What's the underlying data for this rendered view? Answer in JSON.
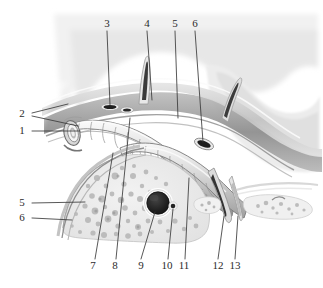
{
  "figure": {
    "width": 323,
    "height": 288,
    "background_color": "#ffffff",
    "line_color": "#3a3a3a",
    "label_color": "#2b2b2b",
    "style": "grayscale medical illustration"
  },
  "palette": {
    "paper": "#ffffff",
    "tissue_light": "#ececec",
    "tissue_mid": "#d2d2d2",
    "tissue_dark": "#9b9b9b",
    "tissue_darker": "#6e6e6e",
    "gland_fill": "#ededed",
    "gland_speckle": "#b6b6b6",
    "lumen_dark": "#2a2a2a",
    "lumen_black": "#1a1a1a",
    "highlight": "#fafafa",
    "leader": "#3a3a3a"
  },
  "labels": [
    {
      "id": "label-1",
      "text": "1",
      "x": 22,
      "y": 131,
      "side": "left"
    },
    {
      "id": "label-2",
      "text": "2",
      "x": 22,
      "y": 114,
      "side": "left"
    },
    {
      "id": "label-3",
      "text": "3",
      "x": 107,
      "y": 24,
      "side": "top"
    },
    {
      "id": "label-4",
      "text": "4",
      "x": 147,
      "y": 24,
      "side": "top"
    },
    {
      "id": "label-5-top",
      "text": "5",
      "x": 175,
      "y": 24,
      "side": "top"
    },
    {
      "id": "label-6-top",
      "text": "6",
      "x": 195,
      "y": 24,
      "side": "top"
    },
    {
      "id": "label-5-left",
      "text": "5",
      "x": 22,
      "y": 203,
      "side": "left"
    },
    {
      "id": "label-6-left",
      "text": "6",
      "x": 22,
      "y": 218,
      "side": "left"
    },
    {
      "id": "label-7",
      "text": "7",
      "x": 93,
      "y": 266,
      "side": "bottom"
    },
    {
      "id": "label-8",
      "text": "8",
      "x": 115,
      "y": 266,
      "side": "bottom"
    },
    {
      "id": "label-9",
      "text": "9",
      "x": 141,
      "y": 266,
      "side": "bottom"
    },
    {
      "id": "label-10",
      "text": "10",
      "x": 167,
      "y": 266,
      "side": "bottom"
    },
    {
      "id": "label-11",
      "text": "11",
      "x": 184,
      "y": 266,
      "side": "bottom"
    },
    {
      "id": "label-12",
      "text": "12",
      "x": 217,
      "y": 266,
      "side": "bottom"
    },
    {
      "id": "label-13",
      "text": "13",
      "x": 234,
      "y": 266,
      "side": "bottom"
    }
  ],
  "leaders": [
    {
      "id": "leader-1",
      "label": "1",
      "points": "32,131 80,131"
    },
    {
      "id": "leader-2a",
      "label": "2",
      "points": "32,113 68,104"
    },
    {
      "id": "leader-2b",
      "label": "2",
      "points": "32,116 78,126"
    },
    {
      "id": "leader-3",
      "label": "3",
      "points": "107,31 110,105"
    },
    {
      "id": "leader-4",
      "label": "4",
      "points": "147,31 152,100"
    },
    {
      "id": "leader-5t",
      "label": "5",
      "points": "175,31 178,118"
    },
    {
      "id": "leader-6t",
      "label": "6",
      "points": "195,31 203,142"
    },
    {
      "id": "leader-5l",
      "label": "5",
      "points": "32,203 85,202"
    },
    {
      "id": "leader-6l",
      "label": "6",
      "points": "32,218 72,220"
    },
    {
      "id": "leader-7",
      "label": "7",
      "points": "95,259 113,153"
    },
    {
      "id": "leader-8",
      "label": "8",
      "points": "116,259 130,118"
    },
    {
      "id": "leader-9",
      "label": "9",
      "points": "141,259 155,212"
    },
    {
      "id": "leader-10",
      "label": "10",
      "points": "168,259 173,209"
    },
    {
      "id": "leader-11",
      "label": "11",
      "points": "185,259 189,178"
    },
    {
      "id": "leader-12",
      "label": "12",
      "points": "218,259 224,216"
    },
    {
      "id": "leader-13",
      "label": "13",
      "points": "235,259 238,216"
    }
  ],
  "structures": {
    "upper_band": "layered fascial/mucosal bands sweeping left to right across upper third",
    "branch_vessel": "slender dark branch ascending near x=145",
    "segmented_tube": "ringed tubular structure (cut end at left, curving right)",
    "gland_body": "pale speckled glandular mass in lower left-center",
    "central_lumen": "dark round lumen with pale halo at center-bottom",
    "small_lumen": "small dark dot right of central lumen",
    "descending_vessel": "dark vessel descending at right near x=226",
    "right_lobules": "small pale speckled lobules at lower right"
  }
}
